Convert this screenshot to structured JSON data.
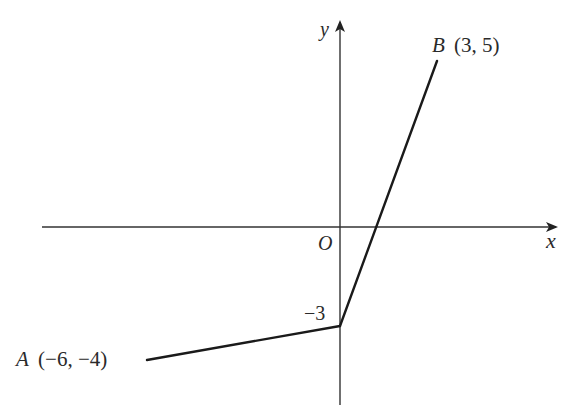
{
  "diagram": {
    "type": "coordinate-graph",
    "axes": {
      "x_label": "x",
      "y_label": "y",
      "origin_label": "O"
    },
    "y_intercept_label": "−3",
    "points": {
      "A": {
        "name": "A",
        "coords": "(−6, −4)",
        "x": -6,
        "y": -4
      },
      "B": {
        "name": "B",
        "coords": "(3, 5)",
        "x": 3,
        "y": 5
      },
      "vertex": {
        "x": 0,
        "y": -3
      }
    },
    "segments": [
      {
        "from": "A",
        "to": "vertex"
      },
      {
        "from": "vertex",
        "to": "B"
      }
    ],
    "colors": {
      "line": "#1a1a1a",
      "axis": "#333333",
      "text": "#2a2a2a"
    }
  }
}
